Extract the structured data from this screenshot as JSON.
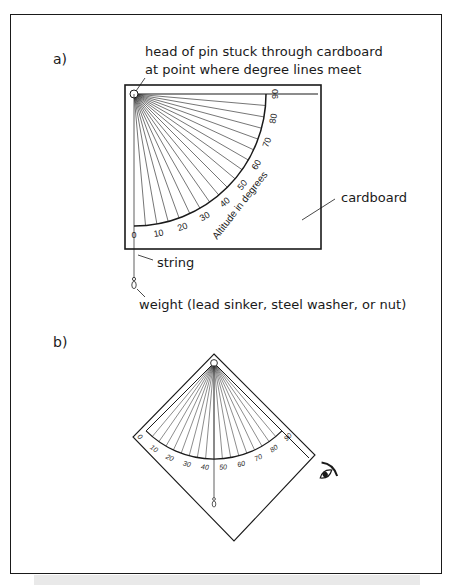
{
  "figure": {
    "panel_a": {
      "label": "a)",
      "pin_caption_line1": "head of pin stuck through cardboard",
      "pin_caption_line2": "at point where degree lines meet",
      "cardboard_label": "cardboard",
      "string_label": "string",
      "weight_label": "weight (lead sinker, steel washer, or nut)",
      "arc_title": "Altitude in degrees",
      "ticks": [
        "0",
        "10",
        "20",
        "30",
        "40",
        "50",
        "60",
        "70",
        "80",
        "90"
      ]
    },
    "panel_b": {
      "label": "b)",
      "ticks": [
        "0",
        "10",
        "20",
        "30",
        "40",
        "50",
        "60",
        "70",
        "80",
        "90"
      ],
      "eye_icon": "eye-icon"
    }
  }
}
